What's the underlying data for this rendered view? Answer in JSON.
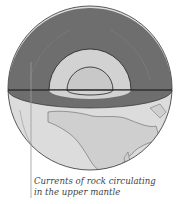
{
  "diagram": {
    "labels": [
      {
        "id": "upper-mantle-currents",
        "line1": "Currents of rock circulating",
        "line2": "in the upper mantle"
      }
    ],
    "colors": {
      "mantle": "#6e6e6e",
      "outer_core": "#d2d2d2",
      "inner_core": "#c8c8c8",
      "surface": "#dcdcdc",
      "outline": "#222222",
      "pointer": "#9a9a9a"
    }
  }
}
